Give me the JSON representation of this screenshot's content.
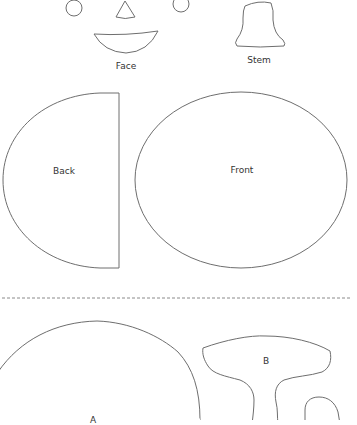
{
  "pattern_sheet": {
    "colors": {
      "background": "#ffffff",
      "outline": "#6e6e6e",
      "label_text": "#333333",
      "cut_line": "#8a8a8a"
    },
    "groups": {
      "face": {
        "label": "Face",
        "parts": [
          "left-eye-circle",
          "nose-triangle",
          "right-eye-circle",
          "mouth-crescent"
        ]
      },
      "stem": {
        "label": "Stem"
      },
      "back": {
        "label": "Back"
      },
      "front": {
        "label": "Front"
      },
      "piece_a": {
        "label": "A"
      },
      "piece_b": {
        "label": "B"
      }
    },
    "divider": {
      "style": "dashed"
    }
  }
}
